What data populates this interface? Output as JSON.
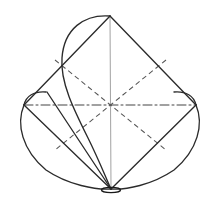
{
  "figure": {
    "canvas": {
      "width": 220,
      "height": 203,
      "background": "#ffffff"
    },
    "colors": {
      "outline": "#2b2b2b",
      "hidden": "#555555",
      "centerline": "#3a3a3a",
      "axis": "#a6a6a6",
      "marker": "#1a1a1a",
      "background": "#ffffff"
    },
    "stroke_widths": {
      "outline": 1.35,
      "hidden": 1.05,
      "centerline": 0.95,
      "axis": 1.05
    },
    "dash_patterns": {
      "hidden": "5,3.5",
      "centerline": "9,3,2,3"
    },
    "points": {
      "top_apex": {
        "label": "top-apex",
        "x": 110,
        "y": 16
      },
      "left_vertex": {
        "label": "left-vertex",
        "x": 24,
        "y": 105
      },
      "right_vertex": {
        "label": "right-vertex",
        "x": 196,
        "y": 105
      },
      "bottom_apex": {
        "label": "bottom-apex",
        "x": 111,
        "y": 189
      },
      "center": {
        "label": "center",
        "x": 110,
        "y": 105
      }
    },
    "paths": {
      "edge_top_left": "M 110 16 L 24 105",
      "edge_top_right": "M 110 16 L 196 105",
      "chord_left_bottom": "M 24 105 L 111 189",
      "chord_right_bottom": "M 196 105 L 111 189",
      "arc_left_outer": "M 24 105 C 16 124 22 150 46 170 C 68 185 96 190 111 189",
      "arc_right_outer": "M 196 105 C 204 124 198 150 174 170 C 152 185 126 190 111 189",
      "arc_left_cap": "M 24 105 C 26 96 34 91 46 92",
      "arc_right_cap": "M 196 105 C 194 96 186 91 174 92",
      "arc_top_sweep": "M 110 16 C 84 14 64 29 62 58 C 60 82 74 110 88 138 C 98 158 106 178 111 189",
      "ray_inner_left": "M 47 92 L 111 189",
      "axis_vertical": "M 110 16 L 111 189",
      "diag_hidden_nw_se": "M 55 60 L 166 150",
      "diag_hidden_ne_sw": "M 166 60 L 55 150",
      "centerline_horizontal": "M 24 105 L 196 105"
    },
    "marker": {
      "pivot": {
        "cx": 111,
        "cy": 190,
        "rx": 9.5,
        "ry": 2.6
      }
    },
    "elements": [
      {
        "name": "edge-top-left",
        "type": "solid-line",
        "style": "outline"
      },
      {
        "name": "edge-top-right",
        "type": "solid-line",
        "style": "outline"
      },
      {
        "name": "chord-left-bottom",
        "type": "solid-line",
        "style": "outline"
      },
      {
        "name": "chord-right-bottom",
        "type": "solid-line",
        "style": "outline"
      },
      {
        "name": "arc-left-outer",
        "type": "curve",
        "style": "outline"
      },
      {
        "name": "arc-right-outer",
        "type": "curve",
        "style": "outline"
      },
      {
        "name": "arc-left-cap",
        "type": "curve",
        "style": "outline"
      },
      {
        "name": "arc-right-cap",
        "type": "curve",
        "style": "outline"
      },
      {
        "name": "arc-top-sweep",
        "type": "curve",
        "style": "outline"
      },
      {
        "name": "ray-inner-left",
        "type": "solid-line",
        "style": "outline"
      },
      {
        "name": "axis-vertical",
        "type": "solid-line",
        "style": "axis"
      },
      {
        "name": "diagonal-hidden-nw-se",
        "type": "dashed-line",
        "style": "hidden"
      },
      {
        "name": "diagonal-hidden-ne-sw",
        "type": "dashed-line",
        "style": "hidden"
      },
      {
        "name": "centerline-horizontal",
        "type": "dash-dot-line",
        "style": "centerline"
      },
      {
        "name": "pivot-marker",
        "type": "ellipse",
        "style": "marker"
      }
    ]
  }
}
